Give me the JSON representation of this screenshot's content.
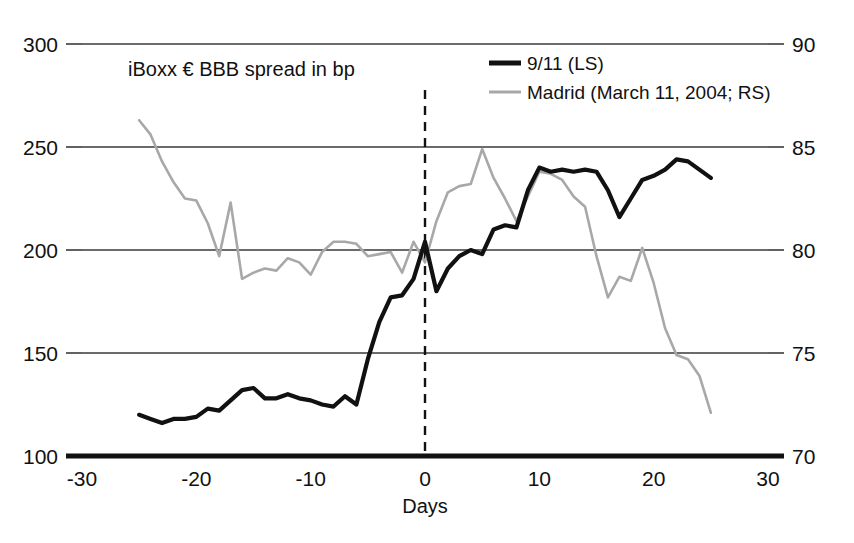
{
  "chart_data": {
    "type": "line",
    "title": "iBoxx € BBB spread in bp",
    "xlabel": "Days",
    "ylabel": "",
    "xlim": [
      -30,
      30
    ],
    "xticks": [
      -30,
      -20,
      -10,
      0,
      10,
      20,
      30
    ],
    "xticklabels": [
      "-30",
      "-20",
      "-10",
      "0",
      "10",
      "20",
      "30"
    ],
    "left_axis": {
      "ylim": [
        100,
        300
      ],
      "yticks": [
        100,
        150,
        200,
        250,
        300
      ],
      "yticklabels": [
        "100",
        "150",
        "200",
        "250",
        "300"
      ]
    },
    "right_axis": {
      "ylim": [
        70,
        90
      ],
      "yticks": [
        70,
        75,
        80,
        85,
        90
      ],
      "yticklabels": [
        "70",
        "75",
        "80",
        "85",
        "90"
      ]
    },
    "grid": true,
    "legend_position": "top-right",
    "annotations": [
      {
        "name": "event-day-zero",
        "type": "vline",
        "x": 0,
        "style": "dashed"
      }
    ],
    "series": [
      {
        "name": "9/11 (LS)",
        "axis": "left",
        "color": "#111111",
        "style": "thick-solid",
        "x": [
          -25,
          -24,
          -23,
          -22,
          -21,
          -20,
          -19,
          -18,
          -17,
          -16,
          -15,
          -14,
          -13,
          -12,
          -11,
          -10,
          -9,
          -8,
          -7,
          -6,
          -5,
          -4,
          -3,
          -2,
          -1,
          0,
          1,
          2,
          3,
          4,
          5,
          6,
          7,
          8,
          9,
          10,
          11,
          12,
          13,
          14,
          15,
          16,
          17,
          18,
          19,
          20,
          21,
          22,
          23,
          24,
          25
        ],
        "values": [
          120,
          118,
          116,
          118,
          118,
          119,
          123,
          122,
          127,
          132,
          133,
          128,
          128,
          130,
          128,
          127,
          125,
          124,
          129,
          125,
          147,
          165,
          177,
          178,
          186,
          204,
          180,
          191,
          197,
          200,
          198,
          210,
          212,
          211,
          229,
          240,
          238,
          239,
          238,
          239,
          238,
          229,
          216,
          225,
          234,
          236,
          239,
          244,
          243,
          239,
          235
        ]
      },
      {
        "name": "Madrid (March 11, 2004; RS)",
        "axis": "right",
        "color": "#a8a8a8",
        "style": "thin-solid",
        "x": [
          -25,
          -24,
          -23,
          -22,
          -21,
          -20,
          -19,
          -18,
          -17,
          -16,
          -15,
          -14,
          -13,
          -12,
          -11,
          -10,
          -9,
          -8,
          -7,
          -6,
          -5,
          -4,
          -3,
          -2,
          -1,
          0,
          1,
          2,
          3,
          4,
          5,
          6,
          7,
          8,
          9,
          10,
          11,
          12,
          13,
          14,
          15,
          16,
          17,
          18,
          19,
          20,
          21,
          22,
          23,
          24,
          25
        ],
        "values": [
          86.3,
          85.6,
          84.3,
          83.3,
          82.5,
          82.4,
          81.3,
          79.7,
          82.3,
          78.6,
          78.9,
          79.1,
          79.0,
          79.6,
          79.4,
          78.8,
          79.9,
          80.4,
          80.4,
          80.3,
          79.7,
          79.8,
          79.9,
          78.9,
          80.4,
          79.4,
          81.4,
          82.8,
          83.1,
          83.2,
          84.9,
          83.5,
          82.5,
          81.4,
          82.6,
          83.8,
          83.7,
          83.4,
          82.6,
          82.1,
          79.7,
          77.7,
          78.7,
          78.5,
          80.1,
          78.4,
          76.2,
          74.9,
          74.7,
          73.9,
          72.1
        ]
      }
    ]
  },
  "legend": {
    "entries": [
      {
        "label": "9/11 (LS)",
        "swatch": "primary"
      },
      {
        "label": "Madrid (March 11, 2004; RS)",
        "swatch": "secondary"
      }
    ]
  },
  "colors": {
    "primary_series": "#111111",
    "secondary_series": "#a8a8a8",
    "grid": "#3a3a3a",
    "background": "#ffffff"
  }
}
